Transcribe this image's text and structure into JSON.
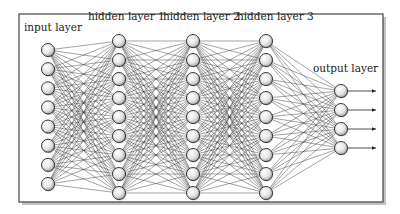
{
  "diagram": {
    "type": "feed-forward neural network",
    "frame": {
      "x": 19,
      "y": 14,
      "width": 364,
      "height": 188
    },
    "colors": {
      "edge": "#3a3a3a",
      "node_stroke": "#222222",
      "node_fill_light": "#ffffff",
      "node_fill_dark": "#a8a8a8",
      "frame": "#444444",
      "shadow": "#bdbdbd"
    },
    "layers": [
      {
        "id": "input",
        "label": "input layer",
        "label_x": 24,
        "label_y": 31,
        "x": 48,
        "nodes": 8,
        "y_start": 50,
        "y_step": 19.14
      },
      {
        "id": "hidden1",
        "label": "hidden layer 1",
        "label_x": 88,
        "label_y": 20,
        "x": 119,
        "nodes": 9,
        "y_start": 41,
        "y_step": 19
      },
      {
        "id": "hidden2",
        "label": "hidden layer 2",
        "label_x": 163,
        "label_y": 20,
        "x": 193,
        "nodes": 9,
        "y_start": 41,
        "y_step": 19
      },
      {
        "id": "hidden3",
        "label": "hidden layer 3",
        "label_x": 237,
        "label_y": 20,
        "x": 266,
        "nodes": 9,
        "y_start": 41,
        "y_step": 19
      },
      {
        "id": "output",
        "label": "output layer",
        "label_x": 313,
        "label_y": 72,
        "x": 341,
        "nodes": 4,
        "y_start": 91,
        "y_step": 19
      }
    ],
    "node_radius": 6.5,
    "output_arrow_end_x": 376
  }
}
